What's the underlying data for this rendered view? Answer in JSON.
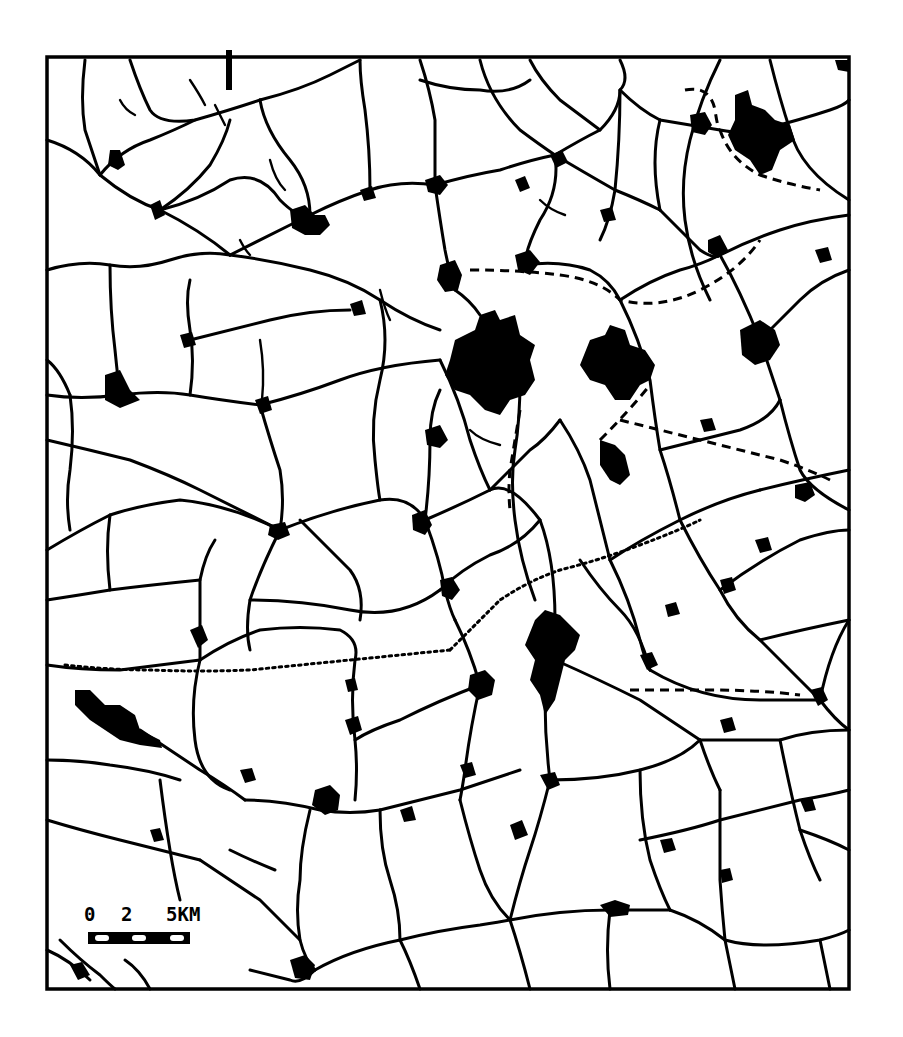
{
  "map": {
    "type": "settlement-and-road-network",
    "style": "black-and-white line map",
    "colors": {
      "ink": "#000000",
      "paper": "#ffffff"
    },
    "frame": {
      "left": 47,
      "top": 57,
      "right": 849,
      "bottom": 989
    },
    "legend": {
      "scale_bar": {
        "labels": [
          "0",
          "2",
          "5KM"
        ],
        "unit": "KM",
        "segments": [
          "black",
          "white",
          "black",
          "white",
          "black",
          "white",
          "black"
        ]
      }
    },
    "features": {
      "roads": "solid black lines",
      "railways": "dashed and dotted lines",
      "settlements": "solid black blobs",
      "major_towns": [
        {
          "name": "central-large-town",
          "approx_center": [
            485,
            360
          ]
        },
        {
          "name": "east-central-town",
          "approx_center": [
            615,
            370
          ]
        },
        {
          "name": "south-central-town",
          "approx_center": [
            555,
            640
          ]
        },
        {
          "name": "northeast-town",
          "approx_center": [
            760,
            130
          ]
        },
        {
          "name": "west-town",
          "approx_center": [
            120,
            710
          ]
        }
      ]
    }
  }
}
